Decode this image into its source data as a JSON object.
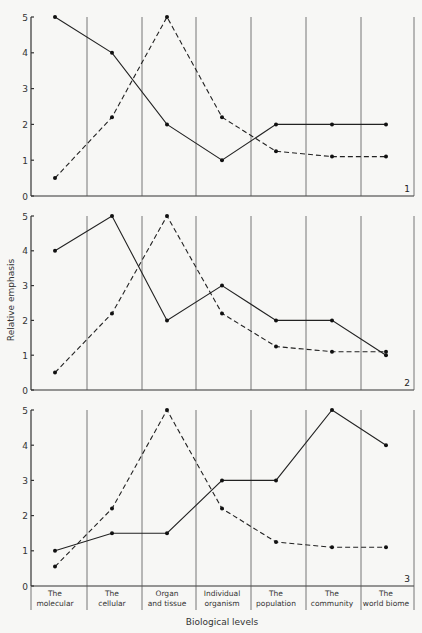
{
  "chart_data": {
    "type": "line",
    "title": "",
    "xlabel": "Biological levels",
    "ylabel": "Relative emphasis",
    "ylim": [
      0,
      5
    ],
    "yticks": [
      0,
      1,
      2,
      3,
      4,
      5
    ],
    "categories": [
      [
        "The",
        "molecular"
      ],
      [
        "The",
        "cellular"
      ],
      [
        "Organ",
        "and tissue"
      ],
      [
        "Individual",
        "organism"
      ],
      [
        "The",
        "population"
      ],
      [
        "The",
        "community"
      ],
      [
        "The",
        "world biome"
      ]
    ],
    "category_labels": [
      "The molecular",
      "The cellular",
      "Organ and tissue",
      "Individual organism",
      "The population",
      "The community",
      "The world biome"
    ],
    "grid": "vertical dividers between categories",
    "panels": [
      {
        "label": "1",
        "series": [
          {
            "name": "solid",
            "style": "solid",
            "values": [
              5,
              4,
              2,
              1,
              2,
              2,
              2
            ]
          },
          {
            "name": "dashed",
            "style": "dashed",
            "values": [
              0.5,
              2.2,
              5,
              2.2,
              1.25,
              1.1,
              1.1
            ]
          }
        ]
      },
      {
        "label": "2",
        "series": [
          {
            "name": "solid",
            "style": "solid",
            "values": [
              4,
              5,
              2,
              3,
              2,
              2,
              1
            ]
          },
          {
            "name": "dashed",
            "style": "dashed",
            "values": [
              0.5,
              2.2,
              5,
              2.2,
              1.25,
              1.1,
              1.1
            ]
          }
        ]
      },
      {
        "label": "3",
        "series": [
          {
            "name": "solid",
            "style": "solid",
            "values": [
              1,
              1.5,
              1.5,
              3,
              3,
              5,
              4
            ]
          },
          {
            "name": "dashed",
            "style": "dashed",
            "values": [
              0.55,
              2.2,
              5,
              2.2,
              1.25,
              1.1,
              1.1
            ]
          }
        ]
      }
    ]
  }
}
